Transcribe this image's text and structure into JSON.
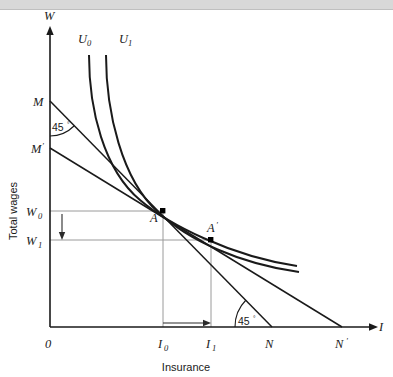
{
  "topbar": {
    "present": true,
    "color": "#d8d8d8"
  },
  "figure": {
    "background": "#ffffff",
    "line_color": "#1a1a1a",
    "grid_color": "#9a9a9a"
  },
  "chart_data": {
    "type": "line",
    "title": "",
    "xlabel": "Insurance",
    "ylabel": "Total wages",
    "x_axis_name": "I",
    "y_axis_name": "W",
    "grid": false,
    "legend_position": "inline-curve-labels",
    "origin_label": "0",
    "x_ticks": [
      {
        "label": "I",
        "sub": "0",
        "x": 163
      },
      {
        "label": "I",
        "sub": "1",
        "x": 211
      },
      {
        "label": "N",
        "sub": "",
        "x": 272
      },
      {
        "label": "N",
        "sub": "′",
        "x": 342
      }
    ],
    "y_ticks": [
      {
        "label": "M",
        "sub": "",
        "y": 101
      },
      {
        "label": "M",
        "sub": "′",
        "y": 148
      },
      {
        "label": "W",
        "sub": "0",
        "y": 211
      },
      {
        "label": "W",
        "sub": "1",
        "y": 240
      }
    ],
    "series": [
      {
        "name": "U0",
        "label": "U",
        "label_sub": "0",
        "kind": "indifference-curve",
        "path": "M 89 55 C 89 110, 104 170, 140 200 C 168 224, 230 256, 297 266"
      },
      {
        "name": "U1",
        "label": "U",
        "label_sub": "1",
        "kind": "indifference-curve",
        "path": "M 106 55 C 106 112, 122 180, 158 212 C 188 240, 240 264, 299 272"
      },
      {
        "name": "budget-M-N",
        "label": "M to N",
        "kind": "budget-line",
        "path": "M 50 101 L 272 327"
      },
      {
        "name": "budget-Mprime-Nprime",
        "label": "M' to N'",
        "kind": "budget-line",
        "path": "M 50 148 L 342 327"
      }
    ],
    "points": [
      {
        "name": "A",
        "label": "A",
        "sub": "",
        "x": 163,
        "y": 211
      },
      {
        "name": "A-prime",
        "label": "A",
        "sub": "′",
        "x": 211,
        "y": 240
      }
    ],
    "angles": [
      {
        "name": "angle-at-M",
        "text": "45",
        "unit": "°",
        "x": 56,
        "y": 128
      },
      {
        "name": "angle-at-N",
        "text": "45",
        "unit": "°",
        "x": 239,
        "y": 325
      }
    ],
    "annotations": [
      {
        "name": "wage-decrease-arrow",
        "direction": "down",
        "from_label": "W0",
        "to_label": "W1"
      },
      {
        "name": "insurance-increase-arrow",
        "direction": "right",
        "from_label": "I0",
        "to_label": "I1"
      }
    ],
    "axis_ranges": {
      "x_origin_px": 50,
      "y_origin_px": 327,
      "x_max_px": 378,
      "y_min_px": 28
    }
  }
}
